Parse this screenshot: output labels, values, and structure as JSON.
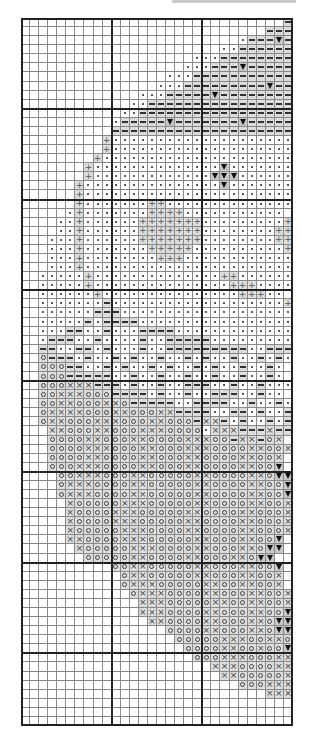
{
  "chart_data": {
    "type": "table",
    "title": "",
    "columns": 30,
    "rows_count": 78,
    "major_grid_every": 10,
    "legend": {
      " ": "empty",
      ".": "dot",
      "-": "dash",
      "v": "triangle",
      "+": "plus",
      "o": "circle",
      "x": "cross"
    },
    "shaded_symbols": [
      "-",
      "v",
      "+",
      "o",
      "x"
    ],
    "rows": [
      "                             -",
      "                           ---",
      "                        .---v-",
      "                      ..------",
      "                   ...--------",
      "                  ...---v-----",
      "                ...-----------",
      "               ...---------v--",
      "             ...-----v--------",
      "            ..----------------",
      "           ..-----------------",
      "          .-----v-------v-----",
      "          --------------------",
      "         +....................",
      "         +....................",
      "        +.....................",
      "       +..............v.......",
      "       +.............vvv......",
      "      +...............v.......",
      "      +.......................",
      "      +.......++..............",
      "     .+.......++++...........",
      "    ..+......+++++++.........+",
      "    ..+......+++++++........++",
      "   ...+......+++++++........++",
      "   ...+.......+++++..........+",
      "   ...+........+++............",
      "   ...+.......................",
      "  .....+..............++......",
      "  .....+...............+++....",
      "  ......+...............+++..",
      "  .......-...................++",
      "  ......---...................",
      "  .....-.----.................",
      "  ...--..-...----.............",
      "  .---..-....-..-----.........",
      "  --..--.-...-..---------..---",
      "  o---.-..-.-..-..-.-..-..-.-.",
      "  ooo--..-.-..-.-..-.-..-..-.",
      "  ooo-----..-..-..-..-..-..-.",
      "  oooxxx---.-..-..---..-..-...",
      "  ooxxxooo----.-..-..---..-..",
      "  ooxxoooxxo-----..----..-..-.",
      "  oxxxxoooxxoooxx----..--.-..-.",
      "  oxxoooxxxoooxxooo-xx-.-..-.-",
      "   xxoooxxoooxxxoooo.xxx---x---",
      "   ooooxxoooxxooooxxxoo-xx-ox",
      "   ooooxxxoooxxoooxxxooooxxoox",
      "   ooooxxooooxxoooxxooooxxoox",
      "   oooxxxooooxxoooxxooooxxoov",
      "    ooxxxoooxxoooooxxooooxxovv",
      "    oxxxooooxxoooooxxooooxxoov",
      "    oxxxooooxxoooooxxooooxxoov",
      "     xoooooxxxoooooxxooooxxoox",
      "     xooooxxxoooooxxooooxxooox",
      "     xooooxxxoooooxxooooxxooox",
      "     xoooooxxxooooxxooooxxooox",
      "     xxooooxxxoooooxxoooxxoov",
      "      xoooooxxxooooxxoooxxovv",
      "       oooooxxooooxxoooxxovv",
      "          ooxxoooooxxoooxxoov",
      "           oxxoooooxxoooxxoox",
      "           oxxxoooooxxooxxoox",
      "            oxxxooooxxoooxxoox",
      "             xxxoooooxxooxxoox",
      "             xxxooooxxoooxxoov",
      "              xxooooxxoooxxovv",
      "                ooooxxoooxxovv",
      "                 oooooxxxooxxovv",
      "                  ooooxxooxoovv",
      "                   oooxxxoooxx",
      "                     xxxooooxxoox",
      "                      xxoooooxxox",
      "                        oooxxxox",
      "                           xxxox",
      "                              ",
      "                              ",
      "                              "
    ]
  },
  "header": {
    "bar_color": "#c8c8c8"
  },
  "colors": {
    "grid_minor": "#888888",
    "grid_major": "#222222",
    "shade_light": "#dcdcdc",
    "shade_dark": "#c8c8c8"
  }
}
